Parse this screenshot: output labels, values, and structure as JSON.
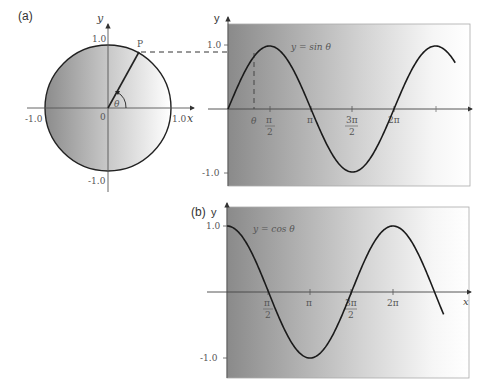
{
  "figure": {
    "panel_a_label": "(a)",
    "panel_b_label": "(b)",
    "unit_circle": {
      "y_axis_label": "y",
      "x_axis_label": "x",
      "origin_label": "0",
      "y_top_label": "1.0",
      "y_bottom_label": "-1.0",
      "x_left_label": "-1.0",
      "x_right_label": "1.0",
      "point_label": "P",
      "angle_label": "θ"
    },
    "sine_panel": {
      "y_axis_label": "y",
      "y_top_label": "1.0",
      "y_bottom_label": "-1.0",
      "curve_label": "y = sin θ",
      "theta_label": "θ",
      "ticks": {
        "pi_over_2_num": "π",
        "pi_over_2_den": "2",
        "pi": "π",
        "three_pi_over_2_num": "3π",
        "three_pi_over_2_den": "2",
        "two_pi": "2π"
      }
    },
    "cosine_panel": {
      "y_axis_label": "y",
      "x_axis_label": "x",
      "y_top_label": "1.0",
      "y_bottom_label": "-1.0",
      "curve_label": "y = cos θ",
      "ticks": {
        "pi_over_2_num": "π",
        "pi_over_2_den": "2",
        "pi": "π",
        "three_pi_over_2_num": "3π",
        "three_pi_over_2_den": "2",
        "two_pi": "2π"
      }
    }
  },
  "chart_data": [
    {
      "type": "diagram",
      "title": "(a) Unit circle",
      "xlabel": "x",
      "ylabel": "y",
      "xlim": [
        -1.0,
        1.0
      ],
      "ylim": [
        -1.0,
        1.0
      ],
      "tick_labels": [
        "-1.0",
        "0",
        "1.0"
      ],
      "annotations": [
        "P",
        "θ"
      ],
      "point_P": {
        "angle_rad": 1.07,
        "x": 0.48,
        "y": 0.88
      }
    },
    {
      "type": "line",
      "title": "(a) y = sin θ",
      "xlabel": "",
      "ylabel": "y",
      "x_tick_labels": [
        "θ",
        "π/2",
        "π",
        "3π/2",
        "2π"
      ],
      "x_ticks": [
        1.07,
        1.5708,
        3.1416,
        4.7124,
        6.2832,
        7.854
      ],
      "y_tick_labels": [
        "1.0",
        "-1.0"
      ],
      "ylim": [
        -1.0,
        1.0
      ],
      "x_range": [
        0,
        8.6
      ],
      "series": [
        {
          "name": "y = sin θ",
          "function": "sin",
          "x": [
            0,
            1.5708,
            3.1416,
            4.7124,
            6.2832,
            7.854,
            8.6
          ],
          "values": [
            0,
            1,
            0,
            -1,
            0,
            1,
            0.73
          ]
        }
      ],
      "annotations": [
        "dashed projection from P to sin θ at θ"
      ]
    },
    {
      "type": "line",
      "title": "(b) y = cos θ",
      "xlabel": "x",
      "ylabel": "y",
      "x_tick_labels": [
        "π/2",
        "π",
        "3π/2",
        "2π"
      ],
      "x_ticks": [
        1.5708,
        3.1416,
        4.7124,
        6.2832
      ],
      "y_tick_labels": [
        "1.0",
        "-1.0"
      ],
      "ylim": [
        -1.0,
        1.0
      ],
      "x_range": [
        0,
        8.2
      ],
      "series": [
        {
          "name": "y = cos θ",
          "function": "cos",
          "x": [
            0,
            1.5708,
            3.1416,
            4.7124,
            6.2832,
            7.854,
            8.2
          ],
          "values": [
            1,
            0,
            -1,
            0,
            1,
            0,
            -0.43
          ]
        }
      ]
    }
  ]
}
